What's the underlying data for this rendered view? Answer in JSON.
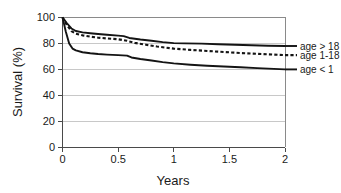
{
  "chart_data": {
    "type": "line",
    "title": "",
    "xlabel": "Years",
    "ylabel": "Survival (%)",
    "xlim": [
      0,
      2
    ],
    "ylim": [
      0,
      100
    ],
    "xticks": [
      "0",
      "0.5",
      "1",
      "1.5",
      "2"
    ],
    "xtick_values": [
      0,
      0.5,
      1,
      1.5,
      2
    ],
    "yticks": [
      "0",
      "20",
      "40",
      "60",
      "80",
      "100"
    ],
    "ytick_values": [
      0,
      20,
      40,
      60,
      80,
      100
    ],
    "grid": "horizontal",
    "legend_position": "right-outside",
    "series": [
      {
        "name": "age > 18",
        "style": "solid",
        "x": [
          0,
          0.04,
          0.08,
          0.12,
          0.18,
          0.25,
          0.32,
          0.4,
          0.5,
          0.55,
          0.6,
          0.7,
          0.8,
          0.9,
          1.0,
          1.1,
          1.25,
          1.4,
          1.55,
          1.7,
          1.85,
          2.0
        ],
        "y": [
          100,
          95.5,
          91.5,
          89.5,
          88.5,
          87.8,
          87.2,
          86.6,
          86.0,
          85.6,
          84.2,
          83.0,
          82.0,
          81.0,
          80.2,
          80.0,
          79.8,
          79.4,
          79.0,
          78.6,
          78.2,
          78.0
        ]
      },
      {
        "name": "age 1-18",
        "style": "dashed",
        "x": [
          0,
          0.04,
          0.08,
          0.12,
          0.18,
          0.25,
          0.32,
          0.4,
          0.5,
          0.58,
          0.65,
          0.75,
          0.85,
          1.0,
          1.15,
          1.3,
          1.45,
          1.6,
          1.75,
          1.9,
          2.0
        ],
        "y": [
          100,
          94.0,
          89.5,
          87.5,
          86.2,
          85.2,
          84.4,
          83.8,
          83.2,
          82.0,
          80.4,
          79.0,
          77.6,
          76.0,
          75.0,
          74.2,
          73.4,
          72.6,
          72.0,
          71.4,
          71.0
        ]
      },
      {
        "name": "age < 1",
        "style": "solid",
        "x": [
          0,
          0.03,
          0.06,
          0.09,
          0.12,
          0.18,
          0.25,
          0.32,
          0.4,
          0.5,
          0.58,
          0.62,
          0.7,
          0.8,
          0.9,
          1.0,
          1.15,
          1.3,
          1.45,
          1.6,
          1.75,
          1.9,
          2.0
        ],
        "y": [
          100,
          89.0,
          80.0,
          76.0,
          74.6,
          73.2,
          72.4,
          71.8,
          71.4,
          71.0,
          70.6,
          69.2,
          68.0,
          66.8,
          65.6,
          64.6,
          63.6,
          62.8,
          62.2,
          61.6,
          61.0,
          60.4,
          60.0
        ]
      }
    ],
    "legend_entries": [
      {
        "label": "age > 18",
        "style": "solid"
      },
      {
        "label": "age 1-18",
        "style": "dashed"
      },
      {
        "label": "age < 1",
        "style": "solid"
      }
    ]
  }
}
